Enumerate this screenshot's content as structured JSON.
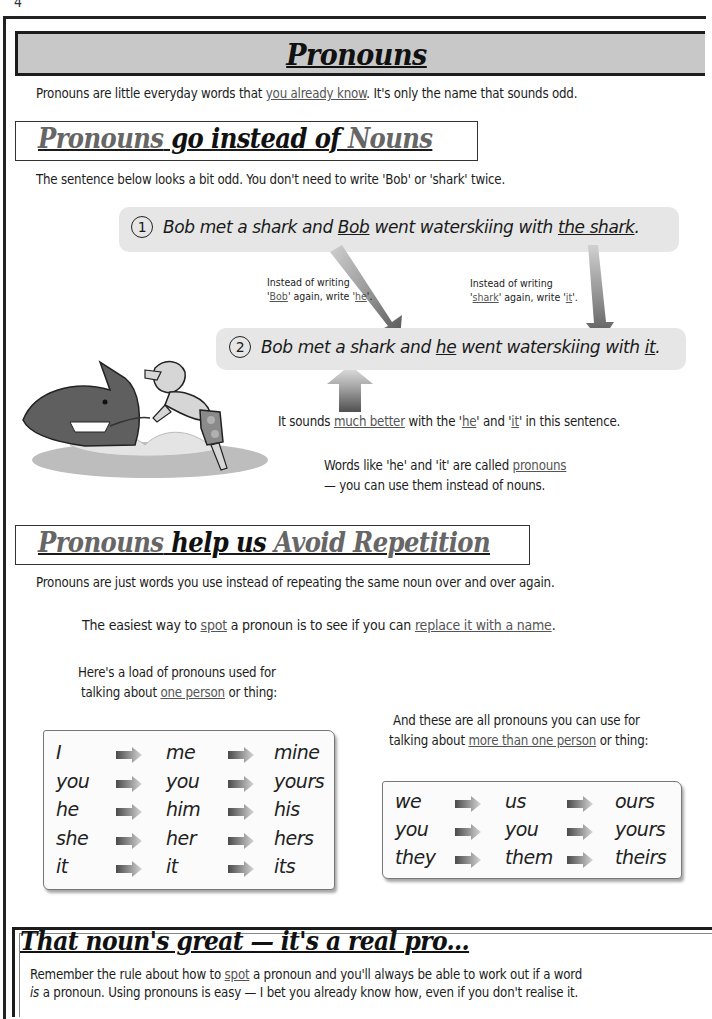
{
  "page": {
    "number": "4"
  },
  "title": "Pronouns",
  "intro": {
    "before": "Pronouns are little everyday words that ",
    "link": "you already know",
    "after": ".  It's only the name that sounds odd."
  },
  "section1": {
    "heading": {
      "part1": "Pronouns",
      "part2": " go instead of ",
      "part3": "Nouns"
    },
    "text": "The sentence below looks a bit odd.  You don't need to write 'Bob' or 'shark' twice.",
    "sentence1": {
      "number": "1",
      "a": "Bob met a shark and ",
      "b": "Bob",
      "c": " went waterskiing with ",
      "d": "the shark",
      "e": "."
    },
    "note_bob": {
      "line1": "Instead of writing",
      "q1": "'",
      "w1": "Bob",
      "mid": "' again, write '",
      "w2": "he",
      "end": "'."
    },
    "note_shark": {
      "line1": "Instead of writing",
      "q1": "'",
      "w1": "shark",
      "mid": "' again, write '",
      "w2": "it",
      "end": "'."
    },
    "sentence2": {
      "number": "2",
      "a": "Bob met a shark and ",
      "b": "he",
      "c": " went waterskiing with ",
      "d": "it",
      "e": "."
    },
    "better": {
      "a": "It sounds ",
      "b": "much better",
      "c": " with the '",
      "d": "he",
      "e": "' and '",
      "f": "it",
      "g": "' in this sentence."
    },
    "called": {
      "line1a": "Words like 'he' and 'it' are called ",
      "line1b": "pronouns",
      "line2": "— you can use them instead of nouns."
    },
    "illustration": "shark-waterskiing-illustration"
  },
  "section2": {
    "heading": {
      "part1": "Pronouns",
      "part2": " help us ",
      "part3": "Avoid Repetition"
    },
    "text": "Pronouns are just words you use instead of repeating the same noun over and over again.",
    "tip": {
      "a": "The easiest way to ",
      "b": "spot",
      "c": " a pronoun is to see if you can ",
      "d": "replace it with a name",
      "e": "."
    },
    "singular": {
      "caption1": "Here's a load of pronouns used for",
      "caption2a": "talking about ",
      "caption2b": "one person",
      "caption2c": " or thing:",
      "rows": [
        [
          "I",
          "me",
          "mine"
        ],
        [
          "you",
          "you",
          "yours"
        ],
        [
          "he",
          "him",
          "his"
        ],
        [
          "she",
          "her",
          "hers"
        ],
        [
          "it",
          "it",
          "its"
        ]
      ]
    },
    "plural": {
      "caption1": "And these are all pronouns you can use for",
      "caption2a": "talking about ",
      "caption2b": "more than one person",
      "caption2c": " or thing:",
      "rows": [
        [
          "we",
          "us",
          "ours"
        ],
        [
          "you",
          "you",
          "yours"
        ],
        [
          "they",
          "them",
          "theirs"
        ]
      ]
    }
  },
  "summary": {
    "heading": "That noun's great —  it's a real pro...",
    "line1a": "Remember the rule about how to ",
    "line1b": "spot",
    "line1c": " a pronoun and you'll always be able to work out if a word",
    "line2a": "is",
    "line2b": " a pronoun.  Using pronouns is easy — I bet you already know how, even if you don't realise it."
  }
}
